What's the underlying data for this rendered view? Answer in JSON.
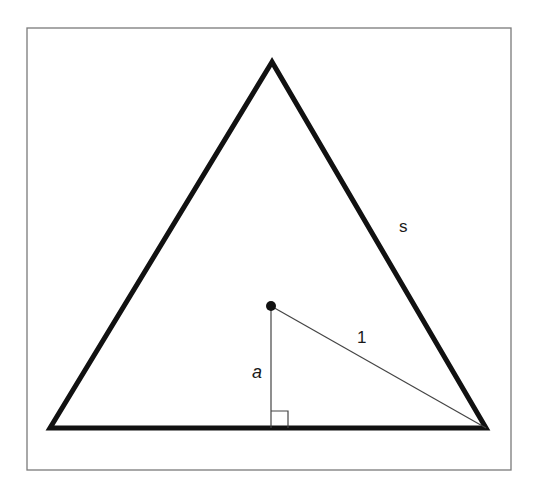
{
  "figure": {
    "colors": {
      "background": "#ffffff",
      "frame": "#7a7a7a",
      "stroke": "#111111",
      "thin_stroke": "#444444"
    },
    "frame": {
      "x": 27,
      "y": 28,
      "width": 484,
      "height": 442
    },
    "triangle": {
      "apex": [
        272,
        62
      ],
      "bottom_left": [
        50,
        428
      ],
      "bottom_right": [
        486,
        428
      ]
    },
    "center_point": [
      271,
      306
    ],
    "foot_point": [
      271,
      428
    ],
    "right_angle_size": 17,
    "labels": {
      "side": {
        "text": "s",
        "x": 399,
        "y": 232
      },
      "radius": {
        "text": "1",
        "x": 357,
        "y": 343
      },
      "apothem": {
        "text": "a",
        "x": 252,
        "y": 378
      }
    }
  }
}
